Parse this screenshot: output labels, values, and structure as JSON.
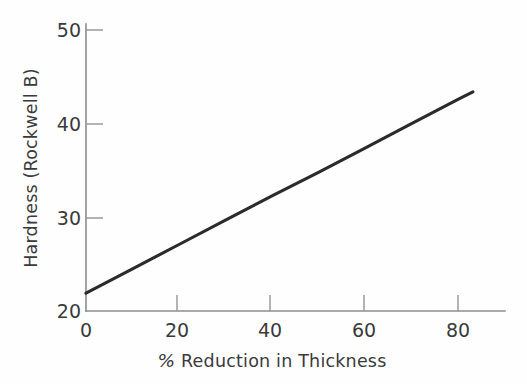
{
  "chart_data": {
    "type": "line",
    "title": "",
    "subtitle": "",
    "xlabel": "% Reduction in Thickness",
    "ylabel": "Hardness (Rockwell B)",
    "xlim": [
      0,
      90
    ],
    "ylim": [
      20,
      50
    ],
    "xticks": [
      0,
      20,
      40,
      60,
      80
    ],
    "xtick_labels": [
      "0",
      "20",
      "40",
      "60",
      "80"
    ],
    "yticks": [
      20,
      30,
      40,
      50
    ],
    "ytick_labels": [
      "20",
      "30",
      "40",
      "50"
    ],
    "grid": false,
    "legend": null,
    "annotations": [],
    "series": [
      {
        "name": "Hardness",
        "color": "#2b2b2b",
        "x": [
          0,
          10,
          20,
          30,
          40,
          50,
          60,
          70,
          80,
          83.2
        ],
        "values": [
          21.9,
          24.5,
          27.1,
          29.7,
          32.3,
          34.8,
          37.4,
          40.0,
          42.6,
          43.4
        ]
      }
    ]
  },
  "axes": {
    "x_label_text": "% Reduction in Thickness",
    "x_label_prefix": "%",
    "x_label_rest": " Reduction in Thickness",
    "y_label_text": "Hardness (Rockwell B)",
    "x_ticks": [
      {
        "value": "0"
      },
      {
        "value": "20"
      },
      {
        "value": "40"
      },
      {
        "value": "60"
      },
      {
        "value": "80"
      }
    ],
    "y_ticks": [
      {
        "value": "50"
      },
      {
        "value": "40"
      },
      {
        "value": "30"
      },
      {
        "value": "20"
      }
    ]
  },
  "colors": {
    "line": "#2b2b2b",
    "spine": "#8c8c8c",
    "tick": "#9a9a9a",
    "text": "#3a3a3a",
    "background": "#fefefe"
  }
}
